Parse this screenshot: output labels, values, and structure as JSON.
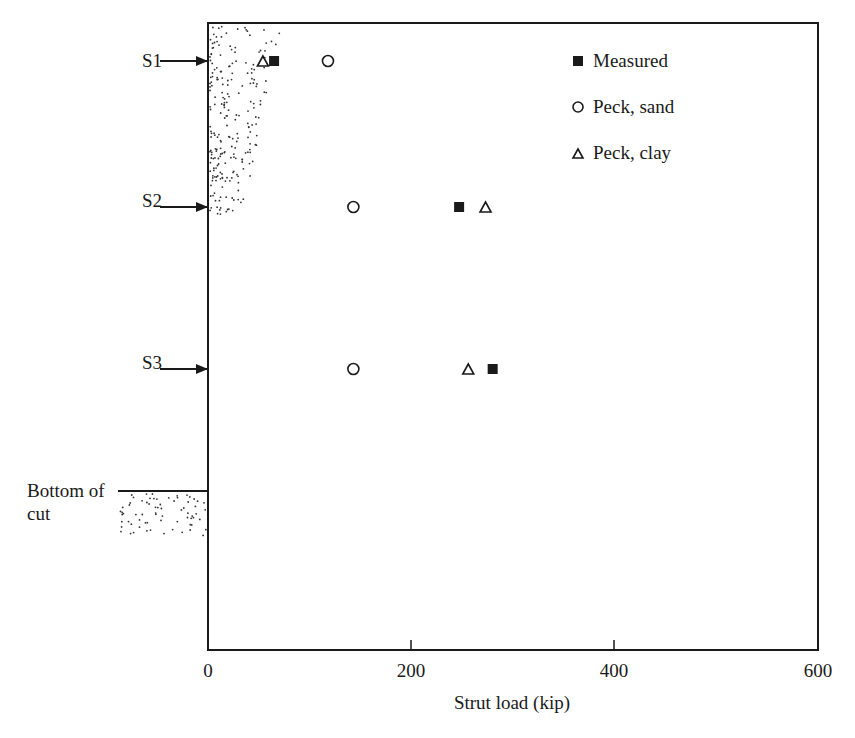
{
  "chart_data": {
    "type": "scatter",
    "title": "",
    "xlabel": "Strut load (kip)",
    "ylabel": "",
    "xlim": [
      0,
      600
    ],
    "x_ticks": [
      0,
      200,
      400,
      600
    ],
    "x_tick_labels": [
      "0",
      "200",
      "400",
      "600"
    ],
    "grid": false,
    "legend_position": "upper right (inside)",
    "categories": [
      "S1",
      "S2",
      "S3"
    ],
    "series": [
      {
        "name": "Measured",
        "marker": "filled-square",
        "values": [
          65,
          247,
          280
        ]
      },
      {
        "name": "Peck, sand",
        "marker": "open-circle",
        "values": [
          118,
          143,
          143
        ]
      },
      {
        "name": "Peck, clay",
        "marker": "open-triangle",
        "values": [
          54,
          273,
          256
        ]
      }
    ],
    "annotations": [
      "S1",
      "S2",
      "S3",
      "Bottom of cut"
    ]
  },
  "labels": {
    "s1": "S1",
    "s2": "S2",
    "s3": "S3",
    "bottom_line1": "Bottom of",
    "bottom_line2": "cut",
    "xlabel": "Strut load (kip)",
    "tick0": "0",
    "tick200": "200",
    "tick400": "400",
    "tick600": "600"
  },
  "legend": {
    "measured": "Measured",
    "peck_sand": "Peck, sand",
    "peck_clay": "Peck, clay"
  },
  "colors": {
    "ink": "#1a1a1a",
    "background": "#ffffff"
  }
}
